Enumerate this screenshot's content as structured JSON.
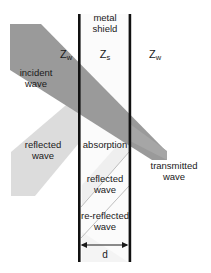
{
  "figure": {
    "name": "electromagnetic-shielding-diagram",
    "background_color": "#ffffff",
    "width": 211,
    "height": 273
  },
  "colors": {
    "incident_band": "#9a9a9a",
    "reflected_band": "#dcdcdc",
    "internal_band": "#ececec",
    "wall": "#111111",
    "shield_fill": "#fbfbfb",
    "text": "#1a1a1a",
    "thin_line": "#b0b0b0"
  },
  "labels": {
    "metal_shield_line1": "metal",
    "metal_shield_line2": "shield",
    "impedance_left": "Z",
    "impedance_left_sub": "w",
    "impedance_shield": "Z",
    "impedance_shield_sub": "s",
    "impedance_right": "Z",
    "impedance_right_sub": "w",
    "incident_line1": "incident",
    "incident_line2": "wave",
    "reflected_outer_line1": "reflected",
    "reflected_outer_line2": "wave",
    "absorption": "absorption",
    "reflected_inner_line1": "reflected",
    "reflected_inner_line2": "wave",
    "re_reflected_line1": "re-reflected",
    "re_reflected_line2": "wave",
    "transmitted_line1": "transmitted",
    "transmitted_line2": "wave",
    "thickness": "d"
  },
  "geometry": {
    "left_wall_x": 79,
    "right_wall_x": 130,
    "wall_top_y": 14,
    "wall_bottom_y": 262,
    "wall_thickness": 2.6,
    "dimension_arrow_y": 245
  }
}
